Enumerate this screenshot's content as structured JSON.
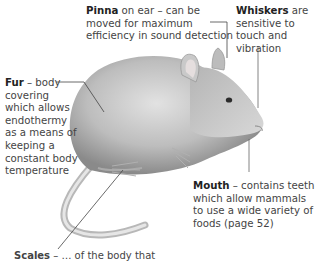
{
  "diagram": {
    "labels": {
      "pinna": {
        "term": "Pinna",
        "text": " on ear – can be moved for maximum efficiency in sound detection"
      },
      "whiskers": {
        "term": "Whiskers",
        "text": " are sensitive to touch and vibration"
      },
      "fur": {
        "term": "Fur",
        "text": " – body covering which allows endothermy as a means of keeping a constant body temperature"
      },
      "mouth": {
        "term": "Mouth",
        "text": " – contains teeth which allow mammals to use a wide variety of foods (page 52)"
      },
      "bottom_clipped": {
        "term": "Scales",
        "text": " – … of the body that"
      }
    }
  }
}
